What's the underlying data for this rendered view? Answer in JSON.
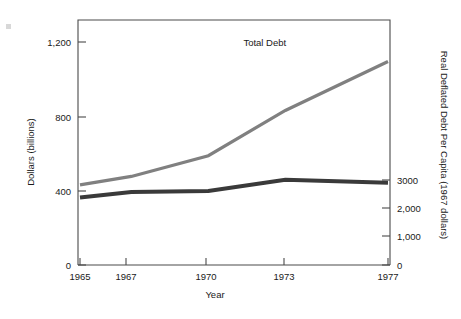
{
  "chart_data": {
    "type": "line",
    "title": "",
    "xlabel": "Year",
    "ylabel": "Dollars (billions)",
    "y2label": "Real Deflated Debt Per Capita (1967 dollars)",
    "x": [
      1965,
      1967,
      1970,
      1973,
      1977
    ],
    "xticklabels": [
      "1965",
      "1967",
      "1970",
      "1973",
      "1977"
    ],
    "xlim": [
      1965,
      1977
    ],
    "ylim": [
      0,
      1300
    ],
    "yticks": [
      0,
      400,
      800,
      1200
    ],
    "yticklabels": [
      "0",
      "400",
      "800",
      "1,200"
    ],
    "y2lim": [
      0,
      8450
    ],
    "y2ticks": [
      0,
      1000,
      2000,
      3000
    ],
    "y2ticklabels": [
      "0",
      "1,000",
      "2,000",
      "3000"
    ],
    "grid": false,
    "legend": "inline-annotations",
    "series": [
      {
        "name": "Total Debt",
        "axis": "left",
        "color": "#808080",
        "linewidth": 3.2,
        "values": [
          425,
          470,
          580,
          820,
          1080
        ],
        "label": "Total Debt",
        "label_x": 1972.2,
        "label_y": 1160
      },
      {
        "name": "Real Debt Per Capita",
        "axis": "right",
        "color": "#3a3a3a",
        "linewidth": 4.0,
        "values": [
          2330,
          2520,
          2550,
          2940,
          2840
        ],
        "label": "Real Debt Per Capita",
        "label_x": 1972.1,
        "label_y": 1600
      }
    ]
  },
  "axes": {
    "left_title": "Dollars (billions)",
    "right_title": "Real Deflated Debt Per Capita (1967 dollars)",
    "bottom_title": "Year",
    "left_ticks": [
      "1,200",
      "800",
      "400",
      "0"
    ],
    "right_ticks": [
      "3000",
      "2,000",
      "1,000",
      "0"
    ],
    "bottom_ticks": [
      "1965",
      "1967",
      "1970",
      "1973",
      "1977"
    ]
  },
  "annotations": {
    "total_debt": "Total Debt",
    "real_debt_per_capita": "Real Debt Per Capita"
  }
}
